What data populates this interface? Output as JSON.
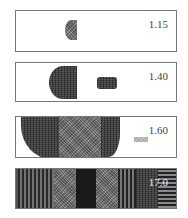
{
  "figure": {
    "panels": [
      {
        "label": "1.15"
      },
      {
        "label": "1.40"
      },
      {
        "label": "1.60"
      },
      {
        "label": "17.0"
      }
    ]
  }
}
